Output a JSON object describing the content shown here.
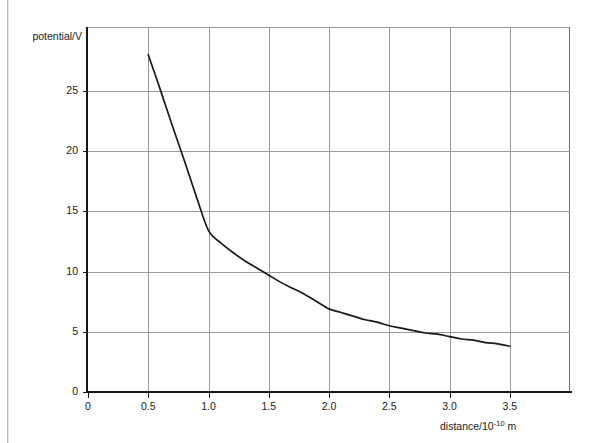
{
  "chart_data": {
    "type": "line",
    "title": "",
    "xlabel": "distance/10⁻¹⁰ m",
    "xlabel_base": "distance/10",
    "xlabel_exponent": "-10",
    "xlabel_unit": " m",
    "ylabel": "potential/V",
    "xlim": [
      0,
      4.0
    ],
    "ylim": [
      0,
      30.3
    ],
    "x_ticks": [
      0,
      0.5,
      1.0,
      1.5,
      2.0,
      2.5,
      3.0,
      3.5
    ],
    "x_tick_labels": [
      "0",
      "0.5",
      "1.0",
      "1.5",
      "2.0",
      "2.5",
      "3.0",
      "3.5"
    ],
    "y_ticks": [
      0,
      5,
      10,
      15,
      20,
      25
    ],
    "y_tick_labels": [
      "0",
      "5",
      "10",
      "15",
      "20",
      "25"
    ],
    "grid": true,
    "grid_color": "#9a9a9a",
    "axis_color": "#161616",
    "curve_color": "#1a1a1a",
    "background": "#ffffff",
    "legend": null,
    "series": [
      {
        "name": "potential",
        "x": [
          0.5,
          0.6,
          0.7,
          0.8,
          0.9,
          1.0,
          1.1,
          1.2,
          1.3,
          1.4,
          1.5,
          1.6,
          1.7,
          1.8,
          1.9,
          2.0,
          2.1,
          2.2,
          2.3,
          2.4,
          2.5,
          2.6,
          2.7,
          2.8,
          2.9,
          3.0,
          3.1,
          3.2,
          3.3,
          3.4,
          3.5
        ],
        "values": [
          28.0,
          25.1,
          22.1,
          19.2,
          16.2,
          13.4,
          12.4,
          11.6,
          10.9,
          10.3,
          9.7,
          9.1,
          8.6,
          8.1,
          7.5,
          6.9,
          6.6,
          6.3,
          6.0,
          5.8,
          5.5,
          5.3,
          5.1,
          4.9,
          4.8,
          4.6,
          4.4,
          4.3,
          4.1,
          4.0,
          3.8
        ]
      }
    ],
    "annotations": []
  }
}
